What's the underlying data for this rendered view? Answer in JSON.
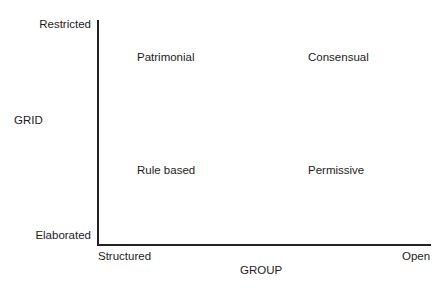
{
  "diagram": {
    "type": "2x2 grid/group typology",
    "y_axis": {
      "title": "GRID",
      "top_label": "Restricted",
      "bottom_label": "Elaborated"
    },
    "x_axis": {
      "title": "GROUP",
      "left_label": "Structured",
      "right_label": "Open"
    },
    "quadrants": {
      "top_left": "Patrimonial",
      "top_right": "Consensual",
      "bottom_left": "Rule based",
      "bottom_right": "Permissive"
    },
    "colors": {
      "background": "#ffffff",
      "axis_line": "#222222",
      "text": "#1c1c1c"
    }
  }
}
